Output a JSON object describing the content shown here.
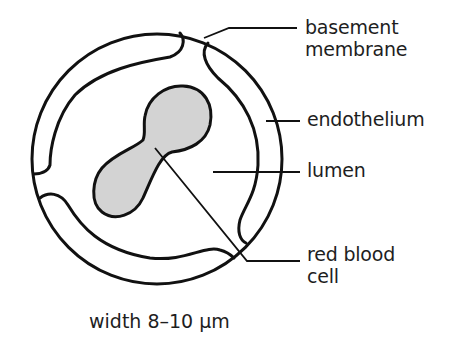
{
  "diagram": {
    "labels": {
      "basement_membrane": {
        "line1": "basement",
        "line2": "membrane"
      },
      "endothelium": "endothelium",
      "lumen": "lumen",
      "red_blood_cell": {
        "line1": "red blood",
        "line2": "cell"
      }
    },
    "caption": "width 8–10 µm",
    "colors": {
      "outline": "#111111",
      "red_blood_cell_fill": "#d3d3d3",
      "background": "#ffffff"
    }
  }
}
